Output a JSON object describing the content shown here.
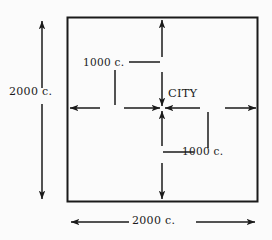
{
  "figure": {
    "type": "technical-diagram",
    "background_color": "#fbfbfb",
    "ink_color": "#1a1a1a"
  },
  "labels": {
    "left_side": "2000 c.",
    "bottom_side": "2000 c.",
    "radius_top": "1000 c.",
    "radius_bottom": "1000 c.",
    "city": "CITY"
  },
  "geometry": {
    "square": {
      "left": 67,
      "top": 17,
      "right": 258,
      "bottom": 202
    },
    "center": {
      "x": 162,
      "y": 108
    },
    "side_length_label": "2000 c.",
    "half_side_label": "1000 c."
  },
  "annotations": {
    "vertical_extent_arrow": {
      "x": 42,
      "from_y": 20,
      "to_y": 200,
      "double_headed": true
    },
    "horizontal_extent_arrow": {
      "y": 222,
      "from_x": 70,
      "to_x": 256,
      "double_headed": true
    },
    "center_arrows": [
      "up-to-top-edge",
      "down-to-center",
      "up-to-center",
      "down-to-bottom-edge",
      "left-to-left-edge",
      "right-to-center",
      "left-to-center",
      "right-to-right-edge"
    ],
    "tick_upper_left": {
      "x": 115,
      "from_y": 70,
      "to_y": 105
    },
    "tick_lower_right": {
      "x": 208,
      "from_y": 112,
      "to_y": 148
    },
    "leader_radius_top": {
      "y": 62,
      "from_x": 129,
      "to_x": 160
    },
    "leader_radius_bottom": {
      "y": 152,
      "from_x": 163,
      "to_x": 194
    }
  }
}
